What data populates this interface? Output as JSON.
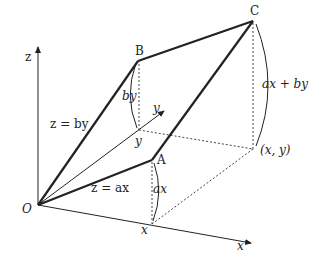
{
  "diagram": {
    "labels": {
      "origin": "O",
      "z_axis": "z",
      "x_axis": "x",
      "y_axis": "y",
      "point_B": "B",
      "point_C": "C",
      "point_A": "A",
      "point_x": "x",
      "point_y": "y",
      "point_xy": "(x, y)",
      "height_by": "by",
      "height_ax": "ax",
      "height_sum": "ax + by",
      "plane_by": "z = by",
      "plane_ax": "z = ax"
    },
    "colors": {
      "line": "#222222",
      "background": "#ffffff"
    }
  }
}
